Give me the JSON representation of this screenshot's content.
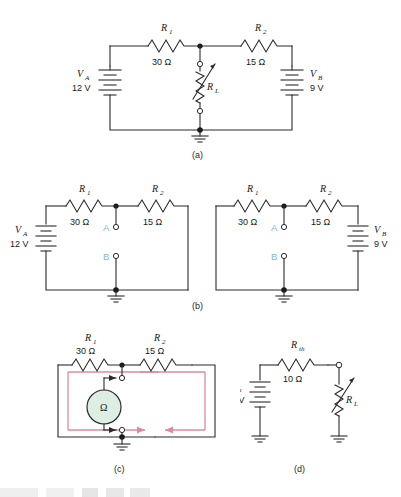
{
  "figure": {
    "type": "circuit-diagram",
    "background": "#ffffff",
    "wire_color": "#2a2a2a",
    "loop_color": "#e08a9e",
    "terminal_label_color": "#7fb8de",
    "meter_fill": "#dfeee4"
  },
  "captions": {
    "a": "(a)",
    "b": "(b)",
    "c": "(c)",
    "d": "(d)"
  },
  "circuit_a": {
    "caption": "(a)",
    "components": {
      "r1_label": "R",
      "r1_sub": "1",
      "r1_value": "30 Ω",
      "r2_label": "R",
      "r2_sub": "2",
      "r2_value": "15 Ω",
      "rl_label": "R",
      "rl_sub": "L",
      "va_label": "V",
      "va_sub": "A",
      "va_value": "12 V",
      "vb_label": "V",
      "vb_sub": "B",
      "vb_value": "9 V"
    }
  },
  "circuit_b_left": {
    "components": {
      "r1_label": "R",
      "r1_sub": "1",
      "r1_value": "30 Ω",
      "r2_label": "R",
      "r2_sub": "2",
      "r2_value": "15 Ω",
      "va_label": "V",
      "va_sub": "A",
      "va_value": "12 V",
      "terminal_a": "A",
      "terminal_b": "B"
    }
  },
  "circuit_b_right": {
    "components": {
      "r1_label": "R",
      "r1_sub": "1",
      "r1_value": "30 Ω",
      "r2_label": "R",
      "r2_sub": "2",
      "r2_value": "15 Ω",
      "vb_label": "V",
      "vb_sub": "B",
      "vb_value": "9 V",
      "terminal_a": "A",
      "terminal_b": "B"
    }
  },
  "circuit_c": {
    "caption": "(c)",
    "components": {
      "r1_label": "R",
      "r1_sub": "1",
      "r1_value": "30 Ω",
      "r2_label": "R",
      "r2_sub": "2",
      "r2_value": "15 Ω",
      "meter_symbol": "Ω",
      "meter_name": "ohmmeter"
    }
  },
  "circuit_d": {
    "caption": "(d)",
    "components": {
      "rth_label": "R",
      "rth_sub": "th",
      "rth_value": "10 Ω",
      "vth_label": "V",
      "vth_sub": "th",
      "vth_value": "10 V",
      "rl_label": "R",
      "rl_sub": "L"
    }
  }
}
